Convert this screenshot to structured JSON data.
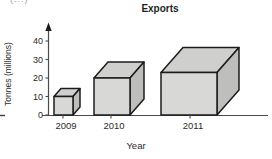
{
  "title": "Exports",
  "corner_mark": "(...)",
  "chart_data": {
    "type": "bar",
    "style": "3d-cubes",
    "title": "Exports",
    "xlabel": "Year",
    "ylabel": "Tonnes (millions)",
    "categories": [
      "2009",
      "2010",
      "2011"
    ],
    "values": [
      10,
      20,
      23
    ],
    "yticks": [
      0,
      10,
      20,
      30,
      40
    ],
    "ylim": [
      0,
      45
    ],
    "grid": "off",
    "legend": "none",
    "colors": {
      "cube_front": "#d8d8d6",
      "cube_top": "#cfcfcd",
      "cube_side": "#bebebc",
      "outline": "#1c1c1c",
      "axis": "#4a4a4a",
      "text": "#2b2b2b"
    }
  }
}
